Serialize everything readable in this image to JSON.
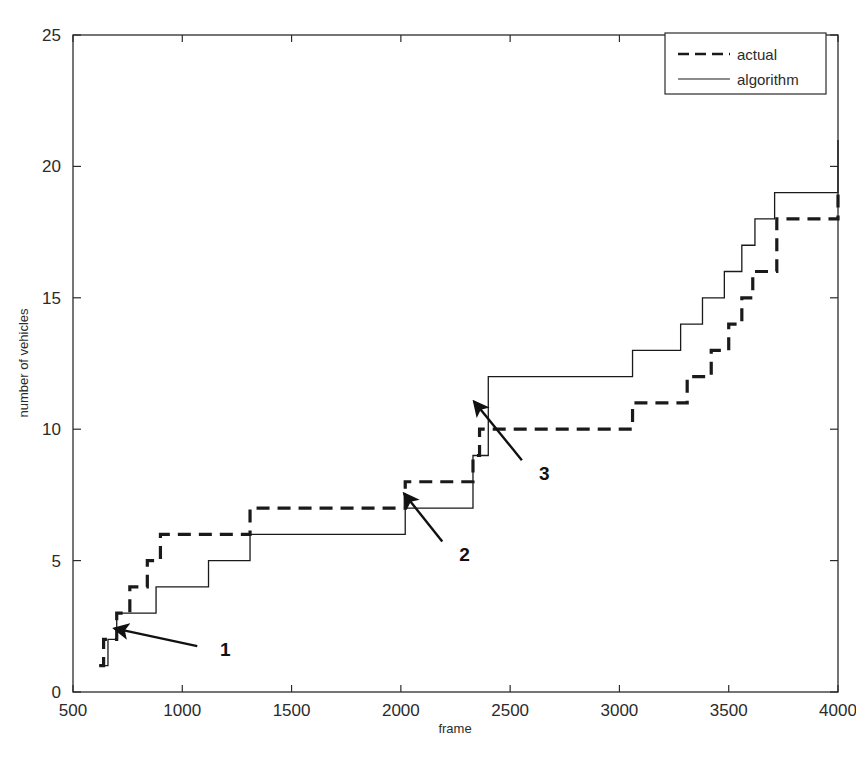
{
  "chart_data": {
    "type": "line",
    "title": "",
    "xlabel": "frame",
    "ylabel": "number of vehicles",
    "xlim": [
      500,
      4000
    ],
    "ylim": [
      0,
      25
    ],
    "xticks": [
      500,
      1000,
      1500,
      2000,
      2500,
      3000,
      3500,
      4000
    ],
    "yticks": [
      0,
      5,
      10,
      15,
      20,
      25
    ],
    "xtick_labels": [
      "500",
      "1000",
      "1500",
      "2000",
      "2500",
      "3000",
      "3500",
      "4000"
    ],
    "ytick_labels": [
      "0",
      "5",
      "10",
      "15",
      "20",
      "25"
    ],
    "grid": false,
    "legend_position": "top-right",
    "step_style": "post",
    "series": [
      {
        "name": "actual",
        "style": "dashed",
        "color": "#1a1a1a",
        "x": [
          620,
          640,
          660,
          700,
          760,
          840,
          900,
          1310,
          2020,
          2330,
          2360,
          2790,
          3060,
          3280,
          3310,
          3420,
          3500,
          3560,
          3610,
          3720,
          4000
        ],
        "y": [
          1,
          2,
          2,
          3,
          4,
          5,
          6,
          7,
          8,
          9,
          10,
          10,
          11,
          11,
          12,
          13,
          14,
          15,
          16,
          18,
          19.2
        ]
      },
      {
        "name": "algorithm",
        "style": "solid",
        "color": "#1a1a1a",
        "x": [
          620,
          660,
          700,
          780,
          880,
          1120,
          1310,
          2020,
          2330,
          2400,
          2780,
          3060,
          3280,
          3380,
          3480,
          3560,
          3620,
          3710,
          4000
        ],
        "y": [
          1,
          2,
          3,
          3,
          4,
          5,
          6,
          7,
          9,
          12,
          12,
          13,
          14,
          15,
          16,
          17,
          18,
          19,
          21
        ]
      }
    ],
    "annotations": [
      {
        "label": "1",
        "label_x": 1140,
        "label_y": 1.62,
        "tip_x": 690,
        "tip_y": 2.42
      },
      {
        "label": "2",
        "label_x": 2235,
        "label_y": 5.25,
        "tip_x": 2015,
        "tip_y": 7.55
      },
      {
        "label": "3",
        "label_x": 2600,
        "label_y": 8.35,
        "tip_x": 2335,
        "tip_y": 11.05
      }
    ]
  },
  "legend": {
    "entries": [
      {
        "label": "actual",
        "style": "dashed"
      },
      {
        "label": "algorithm",
        "style": "solid"
      }
    ]
  },
  "caption": {
    "text": ""
  }
}
